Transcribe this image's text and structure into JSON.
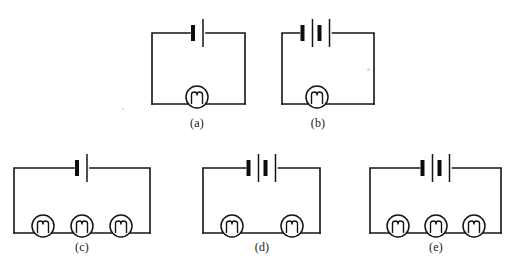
{
  "figure": {
    "title": "",
    "type": "circuit-diagram-set",
    "background_color": "#ffffff",
    "ink_color": "#141414",
    "panel_count": 5,
    "description_terms": {
      "cell_icon": "battery-cell-icon",
      "bulb_icon": "light-bulb-icon",
      "wire_icon": "wire-path"
    }
  },
  "panels": [
    {
      "id": "a",
      "label": "(a)",
      "cells": 1,
      "bulbs": 1,
      "label_x": 197,
      "label_y": 116,
      "frame": {
        "x": 152,
        "y": 33,
        "w": 93,
        "h": 71
      },
      "battery_center_x": 198,
      "bulb_centers_x": [
        197
      ]
    },
    {
      "id": "b",
      "label": "(b)",
      "cells": 2,
      "bulbs": 1,
      "label_x": 318,
      "label_y": 116,
      "frame": {
        "x": 282,
        "y": 33,
        "w": 92,
        "h": 71
      },
      "battery_center_x": 316,
      "bulb_centers_x": [
        317
      ]
    },
    {
      "id": "c",
      "label": "(c)",
      "cells": 1,
      "bulbs": 3,
      "label_x": 82,
      "label_y": 240,
      "frame": {
        "x": 14,
        "y": 168,
        "w": 136,
        "h": 65
      },
      "battery_center_x": 82,
      "bulb_centers_x": [
        43,
        82,
        121
      ]
    },
    {
      "id": "d",
      "label": "(d)",
      "cells": 2,
      "bulbs": 2,
      "label_x": 262,
      "label_y": 240,
      "frame": {
        "x": 203,
        "y": 168,
        "w": 117,
        "h": 65
      },
      "battery_center_x": 262,
      "bulb_centers_x": [
        232,
        292
      ]
    },
    {
      "id": "e",
      "label": "(e)",
      "cells": 2,
      "bulbs": 3,
      "label_x": 436,
      "label_y": 240,
      "frame": {
        "x": 370,
        "y": 168,
        "w": 131,
        "h": 65
      },
      "battery_center_x": 436,
      "bulb_centers_x": [
        398,
        436,
        474
      ]
    }
  ],
  "geometry": {
    "cell_plate_long_half_height": 14,
    "cell_plate_short_half_height": 8,
    "cell_plate_short_width": 4,
    "cell_pair_gap": 10,
    "cell_group_spacing": 17,
    "bulb_radius": 11,
    "bulb_rise": 7
  },
  "specks": [
    {
      "x": 367,
      "y": 68,
      "size": 3
    },
    {
      "x": 122,
      "y": 108,
      "size": 2
    }
  ]
}
